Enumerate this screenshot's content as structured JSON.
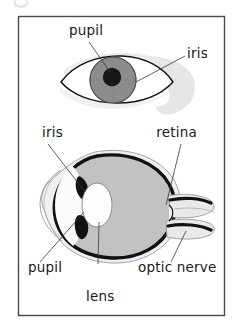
{
  "figure": {
    "corner_mark": "bullet-mark",
    "frame": {
      "border_color": "#4a4a4a",
      "background": "#ffffff",
      "x": 18,
      "y": 16,
      "width": 207,
      "height": 300
    },
    "panels": [
      {
        "name": "external-eye-view",
        "description": "Front view of a human eye showing iris and pupil"
      },
      {
        "name": "eye-cross-section",
        "description": "Side cross-section of the eyeball showing iris, pupil, lens, retina and optic nerve"
      }
    ]
  },
  "colors": {
    "outline": "#1a1a1a",
    "iris_fill": "#8d8d8d",
    "pupil_fill": "#1a1a1a",
    "vitreous_fill": "#c2c2c2",
    "sclera_fill": "#efefef",
    "retina_stroke": "#111111",
    "shadow_fill": "#e4e4e4",
    "label_text": "#1a1a1a",
    "leader_line": "#3a3a3a",
    "frame_border": "#4a4a4a"
  },
  "labels": {
    "top_panel": [
      {
        "id": "pupil-top",
        "text": "pupil",
        "x": 86,
        "y": 35,
        "anchor": "middle"
      },
      {
        "id": "iris-top",
        "text": "iris",
        "x": 187,
        "y": 58,
        "anchor": "start"
      }
    ],
    "bottom_panel": [
      {
        "id": "iris-bottom",
        "text": "iris",
        "x": 42,
        "y": 137,
        "anchor": "start"
      },
      {
        "id": "retina",
        "text": "retina",
        "x": 197,
        "y": 137,
        "anchor": "end"
      },
      {
        "id": "pupil-bottom",
        "text": "pupil",
        "x": 28,
        "y": 272,
        "anchor": "start"
      },
      {
        "id": "optic-nerve",
        "text": "optic nerve",
        "x": 138,
        "y": 272,
        "anchor": "start"
      },
      {
        "id": "lens",
        "text": "lens",
        "x": 86,
        "y": 301,
        "anchor": "start"
      }
    ]
  },
  "structures": {
    "top_view": [
      {
        "name": "eyelid-outline",
        "label": "eyelid opening"
      },
      {
        "name": "iris-circle",
        "label": "iris"
      },
      {
        "name": "pupil-circle",
        "label": "pupil"
      },
      {
        "name": "eye-shadow",
        "label": "eyelid shadow"
      }
    ],
    "cross_section": [
      {
        "name": "cornea",
        "label": "cornea"
      },
      {
        "name": "sclera",
        "label": "sclera"
      },
      {
        "name": "iris-upper",
        "label": "iris (upper)"
      },
      {
        "name": "iris-lower",
        "label": "iris (lower)"
      },
      {
        "name": "lens-oval",
        "label": "lens"
      },
      {
        "name": "vitreous",
        "label": "vitreous body"
      },
      {
        "name": "retina-arc",
        "label": "retina"
      },
      {
        "name": "optic-nerve-body",
        "label": "optic nerve"
      }
    ]
  }
}
